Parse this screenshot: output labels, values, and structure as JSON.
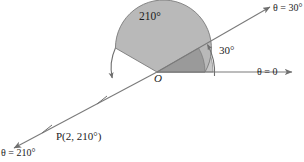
{
  "diagram": {
    "title_label": "210°",
    "origin_label": "O",
    "angle_30_label": "30°",
    "ray_0_label": "θ = 0",
    "ray_30_label": "θ = 30°",
    "ray_210_label": "θ = 210°",
    "point_label": "P(2, 210°)",
    "colors": {
      "sector_210_fill": "#b9b9b9",
      "sector_30_fill": "#c8c8c8",
      "overlap_fill": "#9a9a9a",
      "stroke": "#6f6f6f",
      "axis": "#7a7a7a",
      "text": "#1c1c1c",
      "background": "#ffffff"
    },
    "geometry": {
      "origin_x": 157,
      "origin_y": 72,
      "sector_210_radius": 48,
      "sector_30_radius": 56,
      "angle_start_deg": 0,
      "angle_210_deg": 210,
      "angle_30_deg": 30,
      "tick_marks": 2
    }
  }
}
